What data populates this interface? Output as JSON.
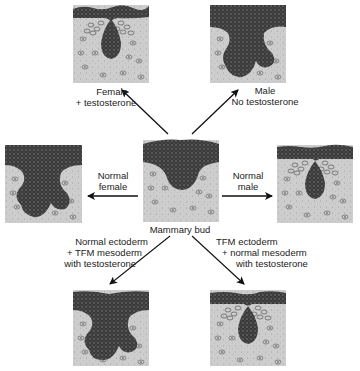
{
  "diagram": {
    "center": {
      "label": "Mammary bud"
    },
    "panels": [
      {
        "id": "top-left",
        "label_lines": [
          "Female",
          "+ testosterone"
        ],
        "bud_shape": "regressed-drop",
        "mesenchyme_condensed": true
      },
      {
        "id": "top-right",
        "label_lines": [
          "Male",
          "No testosterone"
        ],
        "bud_shape": "branched",
        "mesenchyme_condensed": false
      },
      {
        "id": "mid-left",
        "label_lines": [
          "Normal",
          "female"
        ],
        "bud_shape": "branched",
        "mesenchyme_condensed": false
      },
      {
        "id": "mid-right",
        "label_lines": [
          "Normal",
          "male"
        ],
        "bud_shape": "regressed-drop",
        "mesenchyme_condensed": true
      },
      {
        "id": "bottom-left",
        "label_lines": [
          "Normal ectoderm",
          "+ TFM mesoderm",
          "with testosterone"
        ],
        "bud_shape": "branched",
        "mesenchyme_condensed": false
      },
      {
        "id": "bottom-right",
        "label_lines": [
          "TFM ectoderm",
          "+ normal mesoderm",
          "with testosterone"
        ],
        "bud_shape": "regressed-drop",
        "mesenchyme_condensed": true
      }
    ],
    "colors": {
      "epithelium": "#3a3a3a",
      "mesenchyme": "#c9c9c9",
      "arrow": "#111111",
      "text": "#222222"
    }
  }
}
